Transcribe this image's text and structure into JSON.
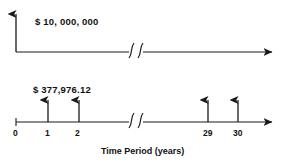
{
  "diagram": {
    "type": "cash-flow-timeline",
    "top_timeline": {
      "amount_label": "$ 10, 000, 000",
      "has_vertical_axis_arrow": true,
      "has_right_arrow": true,
      "has_axis_break": true
    },
    "bottom_timeline": {
      "amount_label": "$ 377,976.12",
      "has_right_arrow": true,
      "has_axis_break": true,
      "arrow_periods": [
        1,
        2,
        29,
        30
      ]
    },
    "axis": {
      "title": "Time Period (years)",
      "tick_labels": [
        "0",
        "1",
        "2",
        "29",
        "30"
      ]
    },
    "colors": {
      "line": "#1a1a1a",
      "text": "#111111",
      "background": "#ffffff"
    }
  }
}
